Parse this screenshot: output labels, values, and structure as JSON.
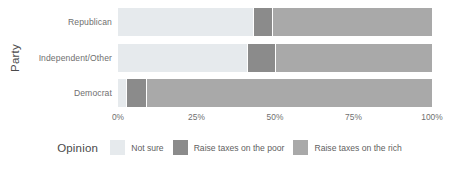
{
  "chart_data": {
    "type": "bar",
    "orientation": "horizontal",
    "stacked": true,
    "stack_mode": "percent",
    "title": "",
    "xlabel": "",
    "ylabel": "Party",
    "categories": [
      "Republican",
      "Independent/Other",
      "Democrat"
    ],
    "x_tick_labels": [
      "0%",
      "25%",
      "50%",
      "75%",
      "100%"
    ],
    "x_tick_values": [
      0,
      25,
      50,
      75,
      100
    ],
    "xlim": [
      0,
      100
    ],
    "grid": false,
    "legend_title": "Opinion",
    "legend_position": "bottom",
    "series": [
      {
        "name": "Not sure",
        "color": "#e6eaed",
        "values": [
          43.0,
          41.0,
          2.5
        ]
      },
      {
        "name": "Raise taxes on the poor",
        "color": "#8b8b8b",
        "values": [
          6.0,
          9.0,
          6.5
        ]
      },
      {
        "name": "Raise taxes on the rich",
        "color": "#a9a9a9",
        "values": [
          51.0,
          50.0,
          91.0
        ]
      }
    ]
  },
  "axes": {
    "y_title": "Party",
    "y_ticks": [
      "Republican",
      "Independent/Other",
      "Democrat"
    ],
    "x_ticks": [
      "0%",
      "25%",
      "50%",
      "75%",
      "100%"
    ]
  },
  "legend": {
    "title": "Opinion",
    "items": [
      {
        "label": "Not sure",
        "color": "#e6eaed"
      },
      {
        "label": "Raise taxes on the poor",
        "color": "#8b8b8b"
      },
      {
        "label": "Raise taxes on the rich",
        "color": "#a9a9a9"
      }
    ]
  }
}
